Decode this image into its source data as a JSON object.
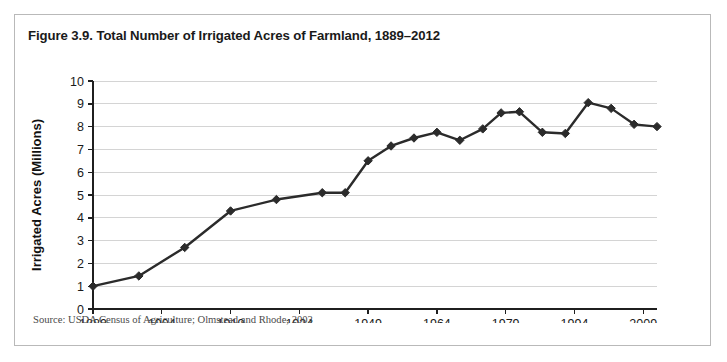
{
  "figure": {
    "title": "Figure 3.9. Total Number of Irrigated Acres of Farmland, 1889–2012",
    "source": "Source: USDA Census of Agriculture; Olmstead and Rhode, 2003"
  },
  "colors": {
    "line": "#2b2b2b",
    "marker": "#2b2b2b",
    "grid": "#d4d4d4",
    "axis": "#1f1f1f",
    "border": "#b9b9b9",
    "background": "#ffffff"
  },
  "chart_data": {
    "type": "line",
    "title": "Figure 3.9. Total Number of Irrigated Acres of Farmland, 1889–2012",
    "xlabel": "",
    "ylabel": "Irrigated Acres (Millions)",
    "xlim": [
      1889,
      2012
    ],
    "ylim": [
      0,
      10
    ],
    "y_ticks": [
      0,
      1,
      2,
      3,
      4,
      5,
      6,
      7,
      8,
      9,
      10
    ],
    "y_tick_labels": [
      "0",
      "1",
      "2",
      "3",
      "4",
      "5",
      "6",
      "7",
      "8",
      "9",
      "10"
    ],
    "x_ticks": [
      1889,
      1904,
      1919,
      1934,
      1949,
      1964,
      1979,
      1994,
      2009
    ],
    "x_tick_labels": [
      "1889",
      "1904",
      "1919",
      "1934",
      "1949",
      "1964",
      "1979",
      "1994",
      "2009"
    ],
    "grid": true,
    "grid_axis": "y",
    "legend": false,
    "marker": "diamond",
    "x": [
      1889,
      1899,
      1909,
      1919,
      1929,
      1939,
      1944,
      1949,
      1954,
      1959,
      1964,
      1969,
      1974,
      1978,
      1982,
      1987,
      1992,
      1997,
      2002,
      2007,
      2012
    ],
    "values": [
      1.0,
      1.45,
      2.7,
      4.3,
      4.8,
      5.1,
      5.1,
      6.5,
      7.15,
      7.5,
      7.75,
      7.4,
      7.9,
      8.6,
      8.65,
      7.75,
      7.7,
      9.05,
      8.8,
      8.1,
      8.0
    ],
    "series": [
      {
        "name": "Irrigated Acres (Millions)",
        "values": [
          1.0,
          1.45,
          2.7,
          4.3,
          4.8,
          5.1,
          5.1,
          6.5,
          7.15,
          7.5,
          7.75,
          7.4,
          7.9,
          8.6,
          8.65,
          7.75,
          7.7,
          9.05,
          8.8,
          8.1,
          8.0
        ]
      }
    ]
  }
}
